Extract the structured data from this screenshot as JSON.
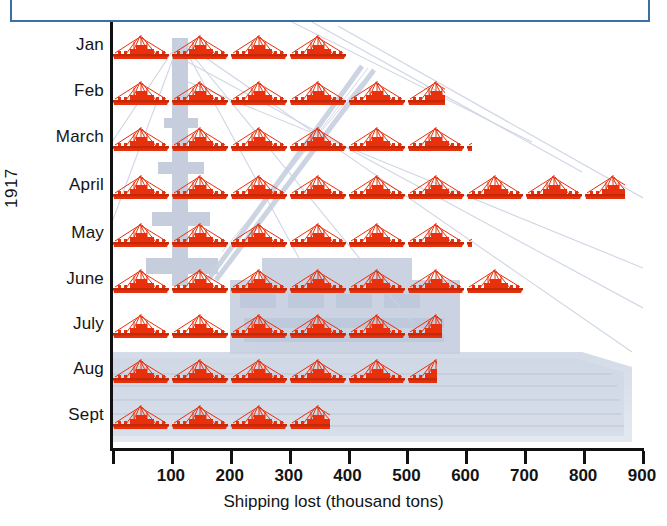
{
  "top_box": {
    "name": "blue-outline-box",
    "border_color": "#3b6fa8"
  },
  "colors": {
    "ship_red": "#e8300c",
    "ship_red_dark": "#c42a08",
    "axis_black": "#111111",
    "watermark_blue": "#c3ccdd",
    "box_blue": "#3b6fa8"
  },
  "axes": {
    "y_title": "1917",
    "x_title": "Shipping lost (thousand tons)",
    "x_ticks": [
      0,
      100,
      200,
      300,
      400,
      500,
      600,
      700,
      800,
      900
    ],
    "x_tick_labels": [
      "",
      "100",
      "200",
      "300",
      "400",
      "500",
      "600",
      "700",
      "800",
      "900"
    ],
    "x_min": 0,
    "x_max": 900,
    "unit_per_icon": 100
  },
  "chart_data": {
    "type": "bar",
    "subtype": "pictogram-isotype",
    "title": "",
    "xlabel": "Shipping lost (thousand tons)",
    "ylabel": "1917",
    "xlim": [
      0,
      900
    ],
    "grid": false,
    "legend": null,
    "icon": "ship-icon",
    "icon_unit": 100,
    "icon_unit_label": "thousand tons",
    "categories": [
      "Jan",
      "Feb",
      "March",
      "April",
      "May",
      "June",
      "July",
      "Aug",
      "Sept"
    ],
    "values": [
      400,
      565,
      610,
      870,
      610,
      700,
      560,
      550,
      370
    ],
    "icons": [
      {
        "month": "Jan",
        "full": 4,
        "partial": 0.0,
        "value": 400
      },
      {
        "month": "Feb",
        "full": 5,
        "partial": 0.65,
        "value": 565
      },
      {
        "month": "March",
        "full": 6,
        "partial": 0.1,
        "value": 610
      },
      {
        "month": "April",
        "full": 8,
        "partial": 0.7,
        "value": 870
      },
      {
        "month": "May",
        "full": 6,
        "partial": 0.1,
        "value": 610
      },
      {
        "month": "June",
        "full": 7,
        "partial": 0.0,
        "value": 700
      },
      {
        "month": "July",
        "full": 5,
        "partial": 0.6,
        "value": 560
      },
      {
        "month": "Aug",
        "full": 5,
        "partial": 0.5,
        "value": 550
      },
      {
        "month": "Sept",
        "full": 3,
        "partial": 0.7,
        "value": 370
      }
    ]
  },
  "rows": [
    {
      "label": "Jan",
      "y": 32,
      "label_y": 36
    },
    {
      "label": "Feb",
      "y": 78,
      "label_y": 82
    },
    {
      "label": "March",
      "y": 124,
      "label_y": 128
    },
    {
      "label": "April",
      "y": 172,
      "label_y": 176
    },
    {
      "label": "May",
      "y": 220,
      "label_y": 224
    },
    {
      "label": "June",
      "y": 266,
      "label_y": 270
    },
    {
      "label": "July",
      "y": 311,
      "label_y": 315
    },
    {
      "label": "Aug",
      "y": 356,
      "label_y": 360
    },
    {
      "label": "Sept",
      "y": 402,
      "label_y": 406
    }
  ]
}
